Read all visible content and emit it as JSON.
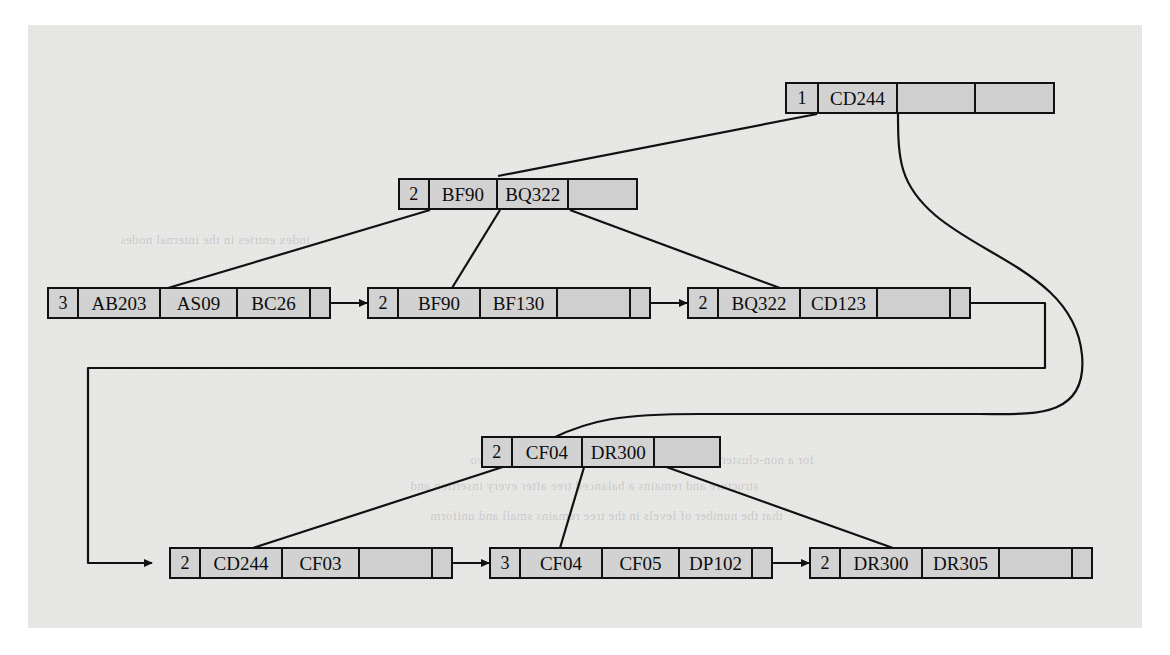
{
  "figure": {
    "type": "b-plus-tree-diagram",
    "background_color": "#e8e8e6",
    "node_fill": "#d2d2d2",
    "line_color": "#111111"
  },
  "root": {
    "id": "root-node",
    "count": "1",
    "keys": [
      "CD244"
    ],
    "cells": [
      "1",
      "CD244",
      "",
      ""
    ]
  },
  "internal_left": {
    "id": "internal-node-bf90",
    "count": "2",
    "keys": [
      "BF90",
      "BQ322"
    ],
    "cells": [
      "2",
      "BF90",
      "BQ322",
      ""
    ]
  },
  "internal_right": {
    "id": "internal-node-cf04",
    "count": "2",
    "keys": [
      "CF04",
      "DR300"
    ],
    "cells": [
      "2",
      "CF04",
      "DR300",
      ""
    ]
  },
  "leaves": [
    {
      "id": "leaf-ab203",
      "count": "3",
      "keys": [
        "AB203",
        "AS09",
        "BC26"
      ],
      "cells": [
        "3",
        "AB203",
        "AS09",
        "BC26"
      ],
      "has_next_pointer": true
    },
    {
      "id": "leaf-bf90",
      "count": "2",
      "keys": [
        "BF90",
        "BF130"
      ],
      "cells": [
        "2",
        "BF90",
        "BF130",
        ""
      ],
      "has_next_pointer": true
    },
    {
      "id": "leaf-bq322",
      "count": "2",
      "keys": [
        "BQ322",
        "CD123"
      ],
      "cells": [
        "2",
        "BQ322",
        "CD123",
        ""
      ],
      "has_next_pointer": true
    },
    {
      "id": "leaf-cd244",
      "count": "2",
      "keys": [
        "CD244",
        "CF03"
      ],
      "cells": [
        "2",
        "CD244",
        "CF03",
        ""
      ],
      "has_next_pointer": true
    },
    {
      "id": "leaf-cf04",
      "count": "3",
      "keys": [
        "CF04",
        "CF05",
        "DP102"
      ],
      "cells": [
        "3",
        "CF04",
        "CF05",
        "DP102"
      ],
      "has_next_pointer": true
    },
    {
      "id": "leaf-dr300",
      "count": "2",
      "keys": [
        "DR300",
        "DR305"
      ],
      "cells": [
        "2",
        "DR300",
        "DR305",
        ""
      ],
      "has_next_pointer": false
    }
  ],
  "bleed_text": [
    {
      "text": "for a non-clustered index with a composite search key on two",
      "x": 470,
      "y": 452
    },
    {
      "text": "structure and remains a balanced tree after every insertion and",
      "x": 410,
      "y": 478
    },
    {
      "text": "that the number of levels in the tree remains small and uniform",
      "x": 430,
      "y": 508
    },
    {
      "text": "the leaf nodes are connected by a linked list",
      "x": 520,
      "y": 562
    },
    {
      "text": "index entries in the internal nodes",
      "x": 120,
      "y": 232
    }
  ]
}
